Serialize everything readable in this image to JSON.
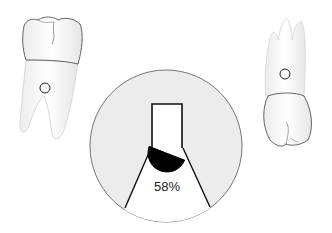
{
  "diagram": {
    "left_tooth": {
      "label": "lower molar (roots down)",
      "marker": "circle"
    },
    "right_tooth": {
      "label": "upper molar (roots up)",
      "marker": "circle"
    },
    "magnifier": {
      "percentage_label": "58%",
      "fill_fraction": 0.58
    }
  },
  "colors": {
    "outline": "#222222",
    "tooth_fill": "#f7f7f7",
    "magnifier_bg": "#ececec",
    "fill_dark": "#000000"
  }
}
